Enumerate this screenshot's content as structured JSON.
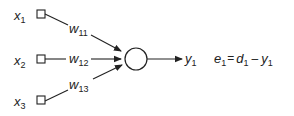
{
  "diagram": {
    "type": "single-neuron",
    "inputs": [
      {
        "var": "x",
        "sub": "1"
      },
      {
        "var": "x",
        "sub": "2"
      },
      {
        "var": "x",
        "sub": "3"
      }
    ],
    "weights": [
      {
        "var": "w",
        "sub": "11"
      },
      {
        "var": "w",
        "sub": "12"
      },
      {
        "var": "w",
        "sub": "13"
      }
    ],
    "output": {
      "var": "y",
      "sub": "1"
    },
    "equation": {
      "lhs_var": "e",
      "lhs_sub": "1",
      "eq": "=",
      "d_var": "d",
      "d_sub": "1",
      "minus": "–",
      "y_var": "y",
      "y_sub": "1"
    },
    "colors": {
      "stroke": "#222222",
      "background": "#ffffff"
    }
  }
}
